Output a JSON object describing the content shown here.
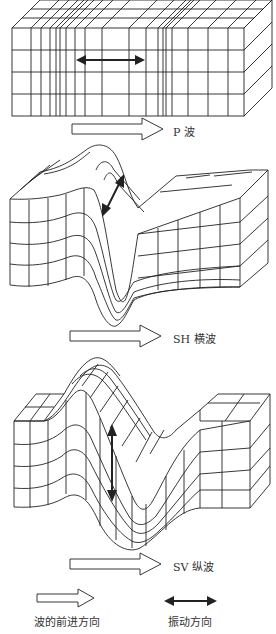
{
  "panels": [
    {
      "id": "p-wave",
      "label": "P 波"
    },
    {
      "id": "sh-wave",
      "label": "SH 横波"
    },
    {
      "id": "sv-wave",
      "label": "SV 纵波"
    }
  ],
  "legend": {
    "propagation_label": "波的前进方向",
    "vibration_label": "振动方向"
  },
  "colors": {
    "line": "#222222",
    "background": "#ffffff"
  }
}
